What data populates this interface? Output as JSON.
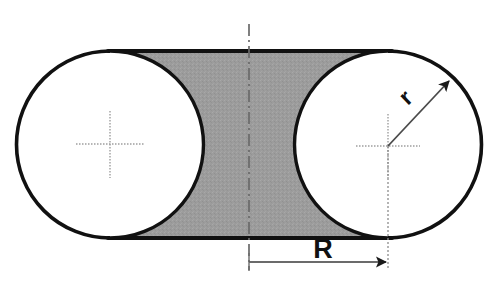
{
  "figure": {
    "canvas": {
      "width": 502,
      "height": 289,
      "background": "#ffffff"
    },
    "colors": {
      "outline": "#111111",
      "shaded_fill": "#9a9a9a",
      "centerline": "#6f6f6f",
      "dimension_line": "#3a3a3a",
      "center_cross": "#9b9b9b",
      "background": "#ffffff"
    },
    "labels": {
      "radius_small": "r",
      "radius_large": "R"
    },
    "geometry": {
      "left_circle": {
        "cx": 110,
        "cy": 144,
        "r": 93
      },
      "right_circle": {
        "cx": 388,
        "cy": 146,
        "r": 93
      },
      "stadium_top_y": 51,
      "stadium_bottom_y": 238,
      "centerline_x": 249,
      "centerline_top_y": 24,
      "centerline_bottom_y": 270,
      "dimension_line_y": 262,
      "radius_leader_angle_deg": -42
    },
    "annotations": {
      "small_radius_note": "Arrow from right circle center outward to its circumference",
      "large_radius_note": "Horizontal dimension from vertical centerline to right circle center",
      "shaded_note": "Gray region between the two circles bounded by the stadium outline"
    }
  }
}
